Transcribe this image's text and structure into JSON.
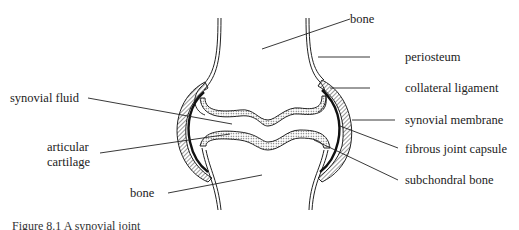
{
  "labels": {
    "bone_top": "bone",
    "periosteum": "periosteum",
    "collateral_ligament": "collateral ligament",
    "synovial_fluid": "synovial fluid",
    "synovial_membrane": "synovial membrane",
    "articular_cartilage_1": "articular",
    "articular_cartilage_2": "cartilage",
    "fibrous_joint_capsule": "fibrous joint capsule",
    "bone_bottom": "bone",
    "subchondral_bone": "subchondral bone"
  },
  "caption": "Figure 8.1  A synovial joint",
  "colors": {
    "line": "#222222",
    "background": "#ffffff"
  }
}
